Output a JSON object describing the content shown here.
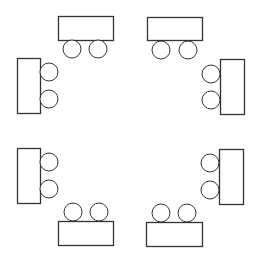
{
  "diagram": {
    "title": "",
    "stroke_color": "#333333",
    "fill_color": "#ffffff",
    "tables": [
      {
        "id": "table-top-left",
        "x": 58,
        "y": 16,
        "w": 55,
        "h": 24
      },
      {
        "id": "table-top-right",
        "x": 147,
        "y": 17,
        "w": 55,
        "h": 23
      },
      {
        "id": "table-left-upper",
        "x": 17,
        "y": 58,
        "w": 23,
        "h": 55
      },
      {
        "id": "table-right-upper",
        "x": 220,
        "y": 59,
        "w": 24,
        "h": 55
      },
      {
        "id": "table-left-lower",
        "x": 17,
        "y": 148,
        "w": 23,
        "h": 55
      },
      {
        "id": "table-right-lower",
        "x": 219,
        "y": 149,
        "w": 24,
        "h": 55
      },
      {
        "id": "table-bottom-left",
        "x": 58,
        "y": 221,
        "w": 55,
        "h": 24
      },
      {
        "id": "table-bottom-right",
        "x": 146,
        "y": 222,
        "w": 56,
        "h": 24
      }
    ],
    "chairs": [
      {
        "table": "table-top-left",
        "cx": 72,
        "cy": 49,
        "r": 9
      },
      {
        "table": "table-top-left",
        "cx": 98,
        "cy": 49,
        "r": 9
      },
      {
        "table": "table-top-right",
        "cx": 161,
        "cy": 50,
        "r": 9
      },
      {
        "table": "table-top-right",
        "cx": 188,
        "cy": 50,
        "r": 9
      },
      {
        "table": "table-left-upper",
        "cx": 49,
        "cy": 72,
        "r": 9
      },
      {
        "table": "table-left-upper",
        "cx": 49,
        "cy": 99,
        "r": 9
      },
      {
        "table": "table-right-upper",
        "cx": 211,
        "cy": 74,
        "r": 9
      },
      {
        "table": "table-right-upper",
        "cx": 211,
        "cy": 100,
        "r": 9
      },
      {
        "table": "table-left-lower",
        "cx": 49,
        "cy": 162,
        "r": 9
      },
      {
        "table": "table-left-lower",
        "cx": 49,
        "cy": 189,
        "r": 9
      },
      {
        "table": "table-right-lower",
        "cx": 210,
        "cy": 163,
        "r": 9
      },
      {
        "table": "table-right-lower",
        "cx": 210,
        "cy": 190,
        "r": 9
      },
      {
        "table": "table-bottom-left",
        "cx": 73,
        "cy": 212,
        "r": 9
      },
      {
        "table": "table-bottom-left",
        "cx": 99,
        "cy": 212,
        "r": 9
      },
      {
        "table": "table-bottom-right",
        "cx": 161,
        "cy": 213,
        "r": 9
      },
      {
        "table": "table-bottom-right",
        "cx": 187,
        "cy": 213,
        "r": 9
      }
    ]
  }
}
